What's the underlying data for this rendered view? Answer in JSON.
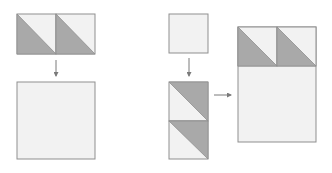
{
  "diagram": {
    "title": "",
    "colors": {
      "light": "#f2f2f2",
      "dark": "#a9a9a9",
      "stroke": "#8f8f8f",
      "arrow": "#7a7a7a",
      "background": "#ffffff"
    },
    "left_column": {
      "top": {
        "type": "hst-pair-horizontal",
        "units": 2
      },
      "arrow": "down",
      "bottom": {
        "type": "plain-square",
        "label": ""
      }
    },
    "right_column": {
      "top": {
        "type": "plain-square-small"
      },
      "arrow_down": "down",
      "middle": {
        "type": "hst-pair-vertical",
        "units": 2
      },
      "arrow_right": "right",
      "result": {
        "type": "hst-row-over-rectangle",
        "units": 2
      }
    }
  }
}
